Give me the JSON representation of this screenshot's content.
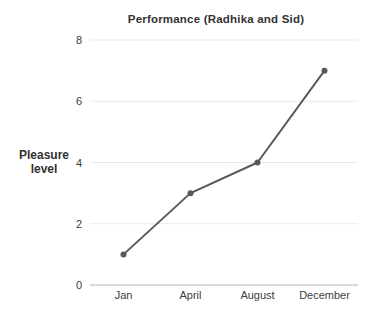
{
  "chart_data": {
    "type": "line",
    "title": "Performance (Radhika and Sid)",
    "ylabel": "Pleasure level",
    "ylabel_lines": {
      "line1": "Pleasure",
      "line2": "level"
    },
    "xlabel": "",
    "categories": [
      "Jan",
      "April",
      "August",
      "December"
    ],
    "series": [
      {
        "name": "Pleasure level",
        "values": [
          1,
          3,
          4,
          7
        ]
      }
    ],
    "values": [
      1,
      3,
      4,
      7
    ],
    "yticks": [
      0,
      2,
      4,
      6,
      8
    ],
    "ylim": [
      0,
      8
    ],
    "grid": true,
    "legend": "none",
    "marker": "circle",
    "colors": {
      "line": "#595959",
      "marker": "#595959",
      "grid": "#e9e9e9",
      "axis": "#b5b5b5",
      "tick_text": "#3d3d3d",
      "title_text": "#333333",
      "background": "#ffffff"
    }
  }
}
